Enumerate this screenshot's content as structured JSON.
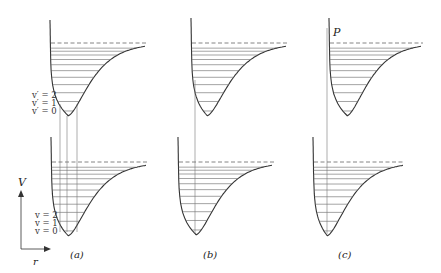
{
  "figure": {
    "axis": {
      "y_label": "V",
      "x_label": "r"
    },
    "panels": [
      {
        "id": "a",
        "caption": "(a)",
        "upper_level_labels": [
          "v′ = 2",
          "v′ = 1",
          "v′ = 0"
        ],
        "lower_level_labels": [
          "v = 2",
          "v = 1",
          "v = 0"
        ],
        "vertical_transitions": 3
      },
      {
        "id": "b",
        "caption": "(b)",
        "vertical_transitions": 1
      },
      {
        "id": "c",
        "caption": "(c)",
        "point_label": "P",
        "vertical_transitions": 1
      }
    ]
  }
}
